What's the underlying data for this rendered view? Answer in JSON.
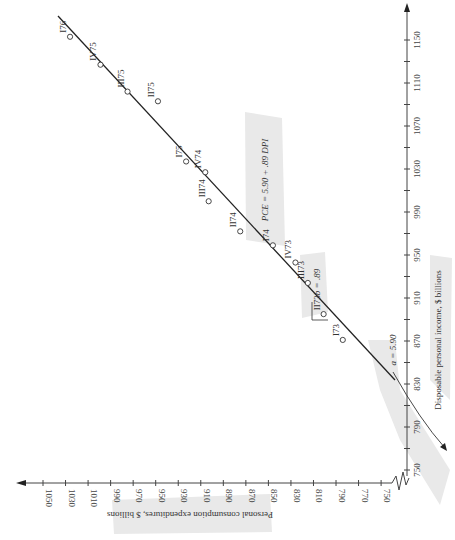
{
  "chart_data": {
    "type": "scatter",
    "title": "",
    "orientation_note": "figure printed rotated 90 degrees",
    "xlabel": "Disposable personal income, $ billions",
    "ylabel": "Personal consumption expenditures, $ billions",
    "x_ticks": [
      750,
      790,
      830,
      870,
      910,
      950,
      990,
      1030,
      1070,
      1110,
      1150
    ],
    "y_ticks": [
      750,
      770,
      790,
      810,
      830,
      850,
      870,
      890,
      910,
      930,
      950,
      970,
      990,
      1010,
      1030,
      1050
    ],
    "xlim": [
      750,
      1170
    ],
    "ylim": [
      750,
      1060
    ],
    "grid": false,
    "series": [
      {
        "name": "Quarterly observations",
        "points": [
          {
            "label": "I73",
            "x": 871,
            "y": 784
          },
          {
            "label": "II73",
            "x": 895,
            "y": 801
          },
          {
            "label": "III73",
            "x": 924,
            "y": 815
          },
          {
            "label": "IV73",
            "x": 943,
            "y": 826
          },
          {
            "label": "I74",
            "x": 959,
            "y": 846
          },
          {
            "label": "II74",
            "x": 972,
            "y": 875
          },
          {
            "label": "III74",
            "x": 1000,
            "y": 903
          },
          {
            "label": "IV74",
            "x": 1027,
            "y": 906
          },
          {
            "label": "I75",
            "x": 1037,
            "y": 923
          },
          {
            "label": "II75",
            "x": 1093,
            "y": 948
          },
          {
            "label": "III75",
            "x": 1102,
            "y": 975
          },
          {
            "label": "IV75",
            "x": 1127,
            "y": 999
          },
          {
            "label": "I76",
            "x": 1153,
            "y": 1026
          }
        ]
      }
    ],
    "regression_line": {
      "equation": "PCE = 5.90 + .89 DPI",
      "intercept": 5.9,
      "slope": 0.89
    },
    "annotations": [
      "a = 5.90",
      "b = .89",
      "PCE = 5.90 + .89 DPI"
    ]
  },
  "labels": {
    "xlabel": "Disposable personal income, $ billions",
    "ylabel": "Personal consumption expenditures, $ billions",
    "equation": "PCE = 5.90 + .89 DPI",
    "intercept": "a = 5.90",
    "slope": "b = .89"
  }
}
